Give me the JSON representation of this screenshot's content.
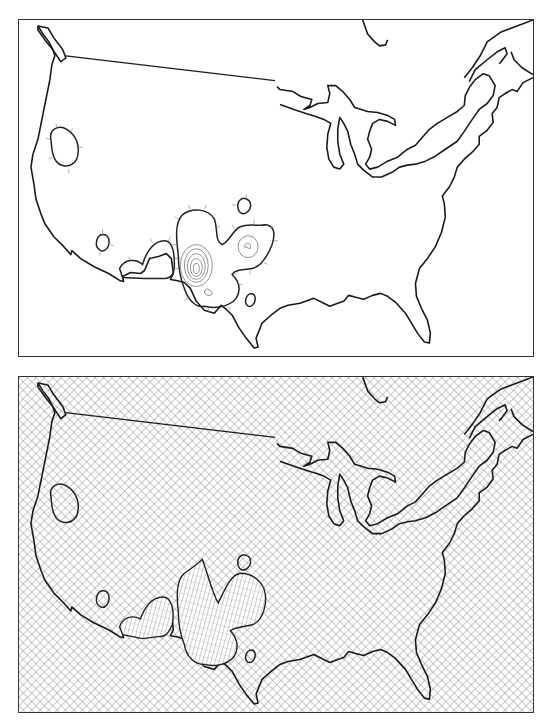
{
  "figure": {
    "panels": [
      {
        "id": "top",
        "description": "Contour map of the contiguous United States with hachured closed contours",
        "style": "white background, black coastline and border, contour lines with tick marks",
        "features": {
          "region": "Contiguous United States and southern Canada",
          "contour_groups": [
            {
              "location": "northern California / Nevada",
              "type": "single closed contour"
            },
            {
              "location": "southern California",
              "type": "small closed contour"
            },
            {
              "location": "Arizona / southern California",
              "type": "closed contour lobe"
            },
            {
              "location": "Arizona / New Mexico",
              "type": "nested concentric contours (peak)"
            },
            {
              "location": "New Mexico / Texas panhandle",
              "type": "closed contour with inner ring"
            },
            {
              "location": "Colorado",
              "type": "small closed contour"
            },
            {
              "location": "west Texas",
              "type": "small closed contour"
            }
          ]
        }
      },
      {
        "id": "bottom",
        "description": "Same region rendered as a cross-hatched surface with elevated mounds in the southwest",
        "style": "cross-hatched background, fine-hatched mounds",
        "features": {
          "region": "Contiguous United States and southern Canada",
          "surface_peaks": [
            {
              "location": "southern California / Arizona",
              "type": "low mound"
            },
            {
              "location": "Arizona / New Mexico",
              "type": "tall peak"
            },
            {
              "location": "New Mexico / Texas panhandle",
              "type": "medium mound"
            }
          ]
        }
      }
    ],
    "colors": {
      "line": "#1a1a1a",
      "hatch": "#8a8a8a",
      "background": "#ffffff"
    }
  }
}
